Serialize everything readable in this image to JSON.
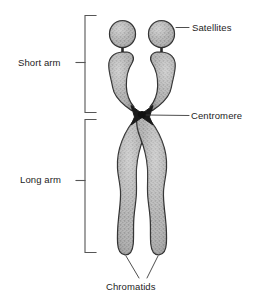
{
  "diagram": {
    "background_color": "#ffffff",
    "ink_color": "#1d1d1d",
    "body_fill": "#a9a9a9",
    "outline_color": "#2b2b2b",
    "bracket_color": "#555555",
    "leader_color": "#3a3a3a",
    "labels": {
      "satellites": "Satellites",
      "centromere": "Centromere",
      "short_arm": "Short arm",
      "long_arm": "Long arm",
      "chromatids": "Chromatids"
    },
    "structures": [
      {
        "name": "satellite-left",
        "kind": "oval-body"
      },
      {
        "name": "satellite-right",
        "kind": "oval-body"
      },
      {
        "name": "stalk-left",
        "kind": "thin-connector"
      },
      {
        "name": "stalk-right",
        "kind": "thin-connector"
      },
      {
        "name": "short-arm-left",
        "kind": "chromatid-arm"
      },
      {
        "name": "short-arm-right",
        "kind": "chromatid-arm"
      },
      {
        "name": "centromere-cross",
        "kind": "pinch-point"
      },
      {
        "name": "long-arm-left",
        "kind": "chromatid-arm"
      },
      {
        "name": "long-arm-right",
        "kind": "chromatid-arm"
      }
    ],
    "brackets": [
      {
        "name": "short-arm-bracket",
        "spans": "Short arm",
        "top": 15,
        "bottom": 113
      },
      {
        "name": "long-arm-bracket",
        "spans": "Long arm",
        "top": 119,
        "bottom": 253
      }
    ],
    "leaders": [
      {
        "name": "satellites-leader",
        "to": "satellite-right"
      },
      {
        "name": "centromere-leader",
        "to": "centromere-cross"
      },
      {
        "name": "chromatids-leader-left",
        "to": "long-arm-left"
      },
      {
        "name": "chromatids-leader-right",
        "to": "long-arm-right"
      }
    ]
  }
}
